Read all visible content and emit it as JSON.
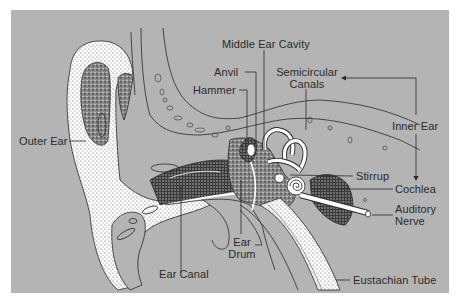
{
  "diagram": {
    "background_color": "#b4b4b4",
    "line_color": "#2a2a2a",
    "labels": {
      "outer_ear": "Outer Ear",
      "middle_ear_cavity": "Middle Ear Cavity",
      "anvil": "Anvil",
      "hammer": "Hammer",
      "semicircular_canals_1": "Semicircular",
      "semicircular_canals_2": "Canals",
      "inner_ear": "Inner Ear",
      "stirrup": "Stirrup",
      "cochlea": "Cochlea",
      "auditory_nerve_1": "Auditory",
      "auditory_nerve_2": "Nerve",
      "ear_drum_1": "Ear",
      "ear_drum_2": "Drum",
      "ear_canal": "Ear Canal",
      "eustachian_tube": "Eustachian Tube"
    }
  }
}
